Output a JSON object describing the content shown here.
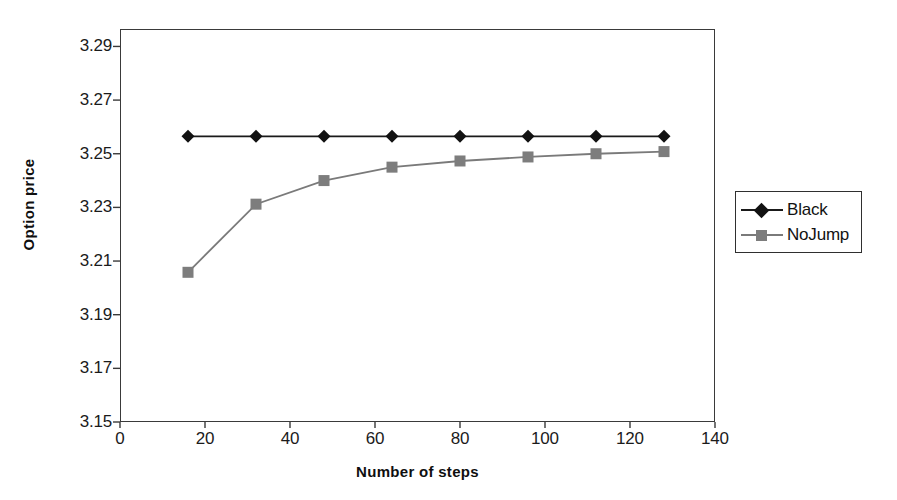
{
  "chart_data": {
    "type": "line",
    "title": "",
    "subtitle": "",
    "xlabel": "Number of steps",
    "ylabel": "Option price",
    "x": [
      16,
      32,
      48,
      64,
      80,
      96,
      112,
      128
    ],
    "xlim": [
      0,
      140
    ],
    "ylim": [
      3.15,
      3.2965
    ],
    "xticks": [
      0,
      20,
      40,
      60,
      80,
      100,
      120,
      140
    ],
    "xtick_labels": [
      "0",
      "20",
      "40",
      "60",
      "80",
      "100",
      "120",
      "140"
    ],
    "yticks": [
      3.15,
      3.17,
      3.19,
      3.21,
      3.23,
      3.25,
      3.27,
      3.29
    ],
    "ytick_labels": [
      "3.15",
      "3.17",
      "3.19",
      "3.21",
      "3.23",
      "3.25",
      "3.27",
      "3.29"
    ],
    "grid": false,
    "legend_position": "right",
    "series": [
      {
        "name": "Black",
        "marker": "diamond",
        "color": "#121212",
        "line_color": "#1a1a1a",
        "values": [
          3.2565,
          3.2565,
          3.2565,
          3.2565,
          3.2565,
          3.2565,
          3.2565,
          3.2565
        ]
      },
      {
        "name": "NoJump",
        "marker": "square",
        "color": "#7d7d7d",
        "line_color": "#7a7a7a",
        "values": [
          3.2058,
          3.2312,
          3.24,
          3.245,
          3.2473,
          3.2488,
          3.25,
          3.2508
        ]
      }
    ]
  },
  "legend": {
    "items": [
      {
        "label": "Black"
      },
      {
        "label": "NoJump"
      }
    ]
  },
  "colors": {
    "background": "#ffffff",
    "axis": "#3a3a3a",
    "text": "#111111",
    "series_black": "#121212",
    "series_nojump": "#7d7d7d"
  }
}
